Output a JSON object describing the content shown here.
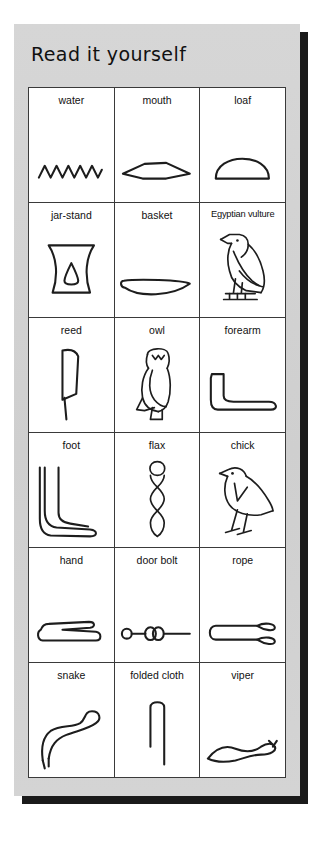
{
  "card": {
    "title": "Read it yourself",
    "background_color": "#d2d2d2",
    "shadow_color": "#1a1a1a",
    "border_color": "#3a3a3a",
    "ink_color": "#1d1d1d"
  },
  "grid": {
    "columns": 3,
    "rows": 6,
    "cells": [
      {
        "label": "water",
        "icon": "water-zigzag-glyph-icon"
      },
      {
        "label": "mouth",
        "icon": "mouth-lens-glyph-icon"
      },
      {
        "label": "loaf",
        "icon": "loaf-semicircle-glyph-icon"
      },
      {
        "label": "jar-stand",
        "icon": "jar-stand-glyph-icon"
      },
      {
        "label": "basket",
        "icon": "basket-glyph-icon"
      },
      {
        "label": "Egyptian vulture",
        "icon": "egyptian-vulture-glyph-icon"
      },
      {
        "label": "reed",
        "icon": "reed-glyph-icon"
      },
      {
        "label": "owl",
        "icon": "owl-glyph-icon"
      },
      {
        "label": "forearm",
        "icon": "forearm-glyph-icon"
      },
      {
        "label": "foot",
        "icon": "foot-glyph-icon"
      },
      {
        "label": "flax",
        "icon": "flax-twisted-wick-glyph-icon"
      },
      {
        "label": "chick",
        "icon": "chick-glyph-icon"
      },
      {
        "label": "hand",
        "icon": "hand-glyph-icon"
      },
      {
        "label": "door bolt",
        "icon": "door-bolt-glyph-icon"
      },
      {
        "label": "rope",
        "icon": "rope-tethering-glyph-icon"
      },
      {
        "label": "snake",
        "icon": "snake-glyph-icon"
      },
      {
        "label": "folded cloth",
        "icon": "folded-cloth-glyph-icon"
      },
      {
        "label": "viper",
        "icon": "horned-viper-glyph-icon"
      }
    ]
  }
}
